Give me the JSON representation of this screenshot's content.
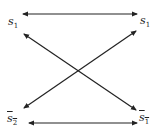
{
  "diagram": {
    "nodes": [
      {
        "id": "top-left",
        "symbol": "s",
        "subscript": "1",
        "overline": false
      },
      {
        "id": "top-right",
        "symbol": "s",
        "subscript": "1",
        "overline": false
      },
      {
        "id": "bottom-left",
        "symbol": "s",
        "subscript": "2",
        "overline": true
      },
      {
        "id": "bottom-right",
        "symbol": "s",
        "subscript": "1",
        "overline": true
      }
    ],
    "edges": [
      {
        "from": "top-left",
        "to": "top-right",
        "type": "double-headed"
      },
      {
        "from": "bottom-left",
        "to": "bottom-right",
        "type": "double-headed"
      },
      {
        "from": "top-left",
        "to": "bottom-right",
        "type": "double-headed"
      },
      {
        "from": "bottom-left",
        "to": "top-right",
        "type": "double-headed"
      }
    ],
    "colors": {
      "line": "#222222",
      "background": "#ffffff"
    }
  }
}
